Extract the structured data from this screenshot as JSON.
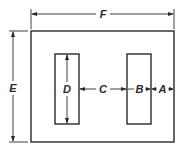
{
  "diagram": {
    "type": "transformer-core-lamination",
    "labels": {
      "A": "A",
      "B": "B",
      "C": "C",
      "D": "D",
      "E": "E",
      "F": "F"
    },
    "dimensions": [
      {
        "label": "F",
        "meaning": "overall width"
      },
      {
        "label": "E",
        "meaning": "overall height"
      },
      {
        "label": "D",
        "meaning": "window height"
      },
      {
        "label": "C",
        "meaning": "center leg width"
      },
      {
        "label": "B",
        "meaning": "window width"
      },
      {
        "label": "A",
        "meaning": "outer leg width"
      }
    ],
    "colors": {
      "stroke": "#2a2a2a",
      "background": "#ffffff"
    }
  }
}
